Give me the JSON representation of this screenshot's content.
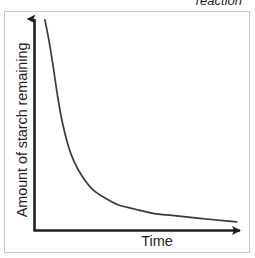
{
  "figure": {
    "caption_fragment": "reaction",
    "frame_color": "#c8c8c8",
    "background_color": "#ffffff"
  },
  "chart_data": {
    "type": "line",
    "title": "",
    "subtitle": "",
    "xlabel": "Time",
    "ylabel": "Amount of starch remaining",
    "axis_color": "#231f20",
    "curve_color": "#3a3a3a",
    "grid": false,
    "legend": null,
    "xlim": [
      0,
      100
    ],
    "ylim": [
      0,
      100
    ],
    "x_tick_labels": [],
    "y_tick_labels": [],
    "axes_have_arrows": true,
    "annotations": [],
    "series": [
      {
        "name": "starch remaining",
        "description": "exponential-style decay: starts high at left, falls steeply, then flattens toward a low plateau",
        "x": [
          5,
          7,
          9,
          11,
          13,
          16,
          19,
          23,
          28,
          34,
          40,
          48,
          57,
          66,
          76,
          86,
          97
        ],
        "y": [
          98,
          88,
          76,
          63,
          52,
          40,
          32,
          25,
          19,
          15,
          12,
          10,
          8,
          7,
          6,
          5,
          4
        ]
      }
    ]
  }
}
